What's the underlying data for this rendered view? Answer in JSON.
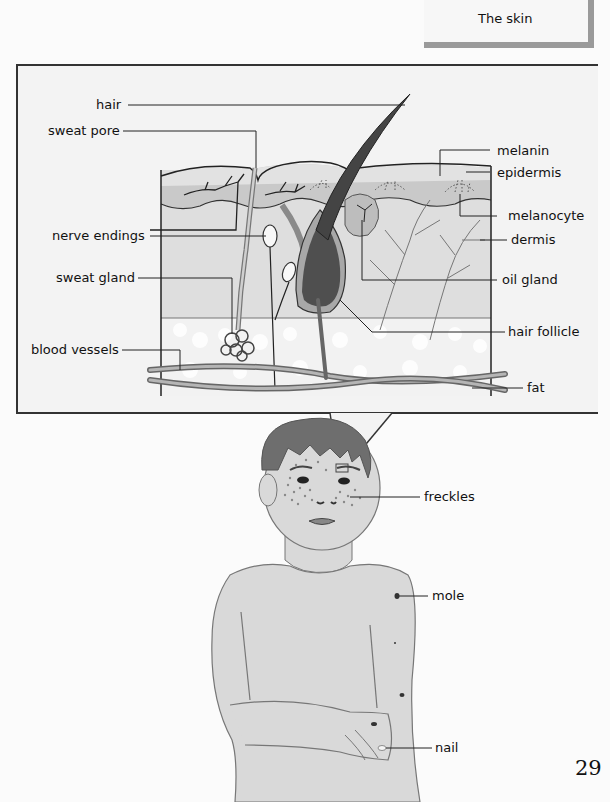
{
  "header": {
    "title": "The skin"
  },
  "skin_diagram": {
    "labels_left": [
      {
        "id": "hair",
        "text": "hair"
      },
      {
        "id": "sweat_pore",
        "text": "sweat pore"
      },
      {
        "id": "nerve_endings",
        "text": "nerve endings"
      },
      {
        "id": "sweat_gland",
        "text": "sweat gland"
      },
      {
        "id": "blood_vessels",
        "text": "blood vessels"
      }
    ],
    "labels_right": [
      {
        "id": "melanin",
        "text": "melanin"
      },
      {
        "id": "epidermis",
        "text": "epidermis"
      },
      {
        "id": "melanocyte",
        "text": "melanocyte"
      },
      {
        "id": "dermis",
        "text": "dermis"
      },
      {
        "id": "oil_gland",
        "text": "oil gland"
      },
      {
        "id": "hair_follicle",
        "text": "hair follicle"
      },
      {
        "id": "fat",
        "text": "fat"
      }
    ],
    "colors": {
      "epidermis": "#c9c9c9",
      "epidermis_top": "#e2e2e2",
      "dermis": "#dedede",
      "fat": "#f2f2f2",
      "hair": "#555555",
      "follicle": "#a8a8a8",
      "vessel": "#8a8a8a"
    }
  },
  "figure": {
    "labels": [
      {
        "id": "freckles",
        "text": "freckles"
      },
      {
        "id": "mole",
        "text": "mole"
      },
      {
        "id": "nail",
        "text": "nail"
      }
    ],
    "colors": {
      "skin": "#d9d9d9",
      "hair": "#6e6e6e",
      "outline": "#777777"
    }
  },
  "page_number": "29"
}
